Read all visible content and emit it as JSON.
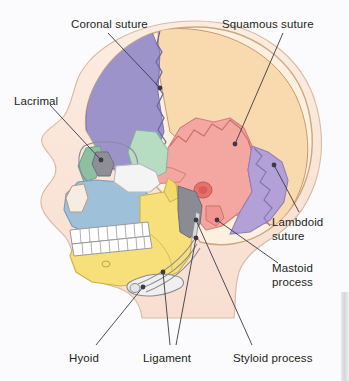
{
  "figure": {
    "background_color": "#fbfbfd",
    "label_color": "#231f20",
    "leader_color": "#3a3a46"
  },
  "labels": [
    {
      "id": "coronal-suture",
      "text": "Coronal suture",
      "x": 71,
      "y": 18,
      "align": "left"
    },
    {
      "id": "squamous-suture",
      "text": "Squamous suture",
      "x": 222,
      "y": 18,
      "align": "left"
    },
    {
      "id": "lacrimal",
      "text": "Lacrimal",
      "x": 14,
      "y": 95,
      "align": "left"
    },
    {
      "id": "lambdoid-suture",
      "text": "Lambdoid\nsuture",
      "x": 272,
      "y": 216,
      "align": "left"
    },
    {
      "id": "mastoid-process",
      "text": "Mastoid\nprocess",
      "x": 272,
      "y": 262,
      "align": "left"
    },
    {
      "id": "hyoid",
      "text": "Hyoid",
      "x": 69,
      "y": 352,
      "align": "left"
    },
    {
      "id": "ligament",
      "text": "Ligament",
      "x": 143,
      "y": 352,
      "align": "left"
    },
    {
      "id": "styloid-process",
      "text": "Styloid process",
      "x": 233,
      "y": 352,
      "align": "left"
    }
  ],
  "leaders": [
    {
      "id": "coronal-suture-leader",
      "path": "M 108 33 L 160 88",
      "dot": [
        160,
        88
      ]
    },
    {
      "id": "squamous-suture-leader",
      "path": "M 283 33 L 235 144",
      "dot": [
        235,
        144
      ]
    },
    {
      "id": "lacrimal-leader",
      "path": "M 50 105 L 101 160",
      "dot": [
        101,
        160
      ]
    },
    {
      "id": "lambdoid-suture-leader",
      "path": "M 274 165 L 299 212",
      "dot": [
        274,
        165
      ]
    },
    {
      "id": "mastoid-process-leader",
      "path": "M 217 220 L 278 263",
      "dot": [
        217,
        220
      ]
    },
    {
      "id": "hyoid-leader",
      "path": "M 96 345 L 143 287",
      "dot": [
        143,
        287
      ]
    },
    {
      "id": "ligament-leader-a",
      "path": "M 170 345 L 163 272",
      "dot": [
        163,
        272
      ]
    },
    {
      "id": "ligament-leader-b",
      "path": "M 176 345 L 196 238",
      "dot": [
        196,
        238
      ]
    },
    {
      "id": "styloid-process-leader",
      "path": "M 252 345 L 196 220",
      "dot": [
        196,
        220
      ]
    },
    {
      "id": "lambdoid-tail",
      "path": "M 299 212 L 299 212",
      "dot": null
    }
  ],
  "bones": [
    {
      "id": "frontal-bone",
      "name": "Frontal bone",
      "color": "#9b93ca"
    },
    {
      "id": "parietal-bone",
      "name": "Parietal bone",
      "color": "#f9d9ae"
    },
    {
      "id": "temporal-bone",
      "name": "Temporal bone",
      "color": "#f4a6a0"
    },
    {
      "id": "occipital-bone",
      "name": "Occipital bone",
      "color": "#b2a0d6"
    },
    {
      "id": "sphenoid-bone",
      "name": "Sphenoid bone",
      "color": "#b6dcc2"
    },
    {
      "id": "zygomatic-bone",
      "name": "Zygomatic bone",
      "color": "#f2f2f2"
    },
    {
      "id": "maxilla",
      "name": "Maxilla",
      "color": "#9fc0d9"
    },
    {
      "id": "mandible",
      "name": "Mandible",
      "color": "#f7e07a"
    },
    {
      "id": "nasal-bone",
      "name": "Nasal bone",
      "color": "#8fbfa3"
    },
    {
      "id": "lacrimal-bone",
      "name": "Lacrimal bone",
      "color": "#8e8e96"
    },
    {
      "id": "hyoid-bone",
      "name": "Hyoid bone",
      "color": "#efefef"
    },
    {
      "id": "scalp-outline",
      "name": "Soft tissue profile",
      "color": "#fae3cf"
    },
    {
      "id": "teeth",
      "name": "Teeth",
      "color": "#ffffff"
    }
  ]
}
